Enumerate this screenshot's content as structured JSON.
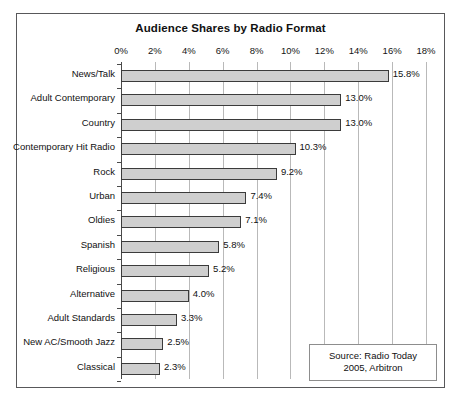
{
  "chart_data": {
    "type": "bar",
    "orientation": "horizontal",
    "title": "Audience Shares by Radio Format",
    "xlabel": "",
    "ylabel": "",
    "xlim": [
      0,
      18
    ],
    "xtick_step": 2,
    "xticks": [
      "0%",
      "2%",
      "4%",
      "6%",
      "8%",
      "10%",
      "12%",
      "14%",
      "16%",
      "18%"
    ],
    "xtick_values": [
      0,
      2,
      4,
      6,
      8,
      10,
      12,
      14,
      16,
      18
    ],
    "grid": "vertical",
    "legend": "none",
    "categories": [
      "News/Talk",
      "Adult Contemporary",
      "Country",
      "Contemporary Hit Radio",
      "Rock",
      "Urban",
      "Oldies",
      "Spanish",
      "Religious",
      "Alternative",
      "Adult Standards",
      "New AC/Smooth Jazz",
      "Classical"
    ],
    "values": [
      15.8,
      13.0,
      13.0,
      10.3,
      9.2,
      7.4,
      7.1,
      5.8,
      5.2,
      4.0,
      3.3,
      2.5,
      2.3
    ],
    "data_labels": [
      "15.8%",
      "13.0%",
      "13.0%",
      "10.3%",
      "9.2%",
      "7.4%",
      "7.1%",
      "5.8%",
      "5.2%",
      "4.0%",
      "3.3%",
      "2.5%",
      "2.3%"
    ],
    "bar_color": "#cfcfcf",
    "bar_border_color": "#3b3b3b",
    "gridline_color": "#b9b9b9",
    "axis_color": "#4a4a4a",
    "annotations": [
      {
        "name": "source-note",
        "line1": "Source: Radio Today",
        "line2": "2005, Arbitron"
      }
    ]
  },
  "source_box": {
    "line1": "Source: Radio Today",
    "line2": "2005, Arbitron"
  },
  "caption": ""
}
